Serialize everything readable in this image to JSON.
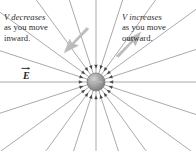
{
  "figure": {
    "background_color": "#ffffff",
    "width": 196,
    "height": 151,
    "top_cut_text": "",
    "charge": {
      "sign_symbol": "−",
      "type": "negative-point-charge",
      "center_x": 96,
      "center_y": 82,
      "radius": 9,
      "fill_color": "#9a9a9a",
      "edge_color": "#6d6d6d"
    },
    "field": {
      "line_color": "#8e8e8e",
      "arrow_color": "#4a4a4a",
      "line_count": 20,
      "direction": "inward",
      "label": "E",
      "label_is_vector": true
    },
    "annotation_arrows": {
      "color": "#bdbdbd",
      "left": {
        "name": "inward-arrow",
        "direction": "down-left"
      },
      "right": {
        "name": "outward-arrow",
        "direction": "up-right"
      }
    },
    "captions": {
      "left": {
        "emphasis": "V decreases",
        "line2": "as you move",
        "line3": "inward."
      },
      "right": {
        "emphasis": "V increases",
        "line2": "as you move",
        "line3": "outward."
      }
    }
  }
}
